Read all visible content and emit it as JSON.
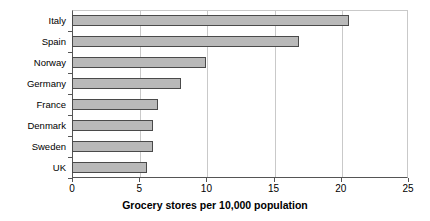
{
  "chart_data": {
    "type": "bar",
    "orientation": "horizontal",
    "title": "",
    "xlabel": "Grocery stores per 10,000 population",
    "ylabel": "",
    "categories": [
      "Italy",
      "Spain",
      "Norway",
      "Germany",
      "France",
      "Denmark",
      "Sweden",
      "UK"
    ],
    "values": [
      20.6,
      16.9,
      10.0,
      8.1,
      6.4,
      6.0,
      6.0,
      5.6
    ],
    "xlim": [
      0,
      25
    ],
    "xticks": [
      0,
      5,
      10,
      15,
      20,
      25
    ],
    "xtick_labels": [
      "0",
      "5",
      "10",
      "15",
      "20",
      "25"
    ],
    "grid": "vertical",
    "legend": "none",
    "bar_fill_color": "#b9b9b9",
    "bar_border_color": "#4a4a4a",
    "gridline_color": "#c9c9c9",
    "axis_color": "#555555",
    "background_color": "#ffffff"
  }
}
